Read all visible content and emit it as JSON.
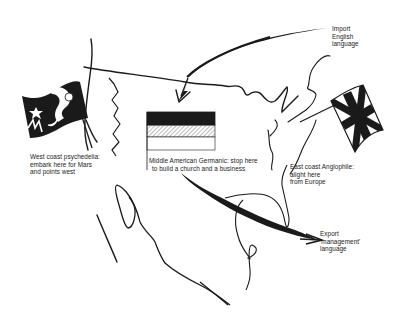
{
  "diagram": {
    "colors": {
      "ink": "#1a1a1a",
      "background": "#ffffff",
      "hatch": "#9a9a9a"
    },
    "labels": {
      "west_coast": [
        "West coast psychedelia:",
        "embark here for Mars",
        "and points west"
      ],
      "middle_american": [
        "Middle American Germanic:  stop here",
        "to build a church and a business"
      ],
      "east_coast": [
        "East coast Anglophile:",
        "alight here",
        "from Europe"
      ],
      "import": [
        "Import",
        "English",
        "language"
      ],
      "export": [
        "Export",
        "'management'",
        "language"
      ]
    },
    "flags": [
      {
        "name": "psychedelic-flag",
        "position": "west coast",
        "motifs": [
          "star",
          "moon",
          "figure"
        ]
      },
      {
        "name": "german-flag",
        "position": "middle america",
        "stripes": [
          "black",
          "hatched",
          "white"
        ]
      },
      {
        "name": "union-jack-flag",
        "position": "east coast"
      }
    ],
    "arrows": [
      {
        "name": "import-arrow",
        "from": "Europe (top right)",
        "to": "North America"
      },
      {
        "name": "export-arrow",
        "from": "Middle America",
        "to": "outward (bottom right)"
      }
    ]
  }
}
